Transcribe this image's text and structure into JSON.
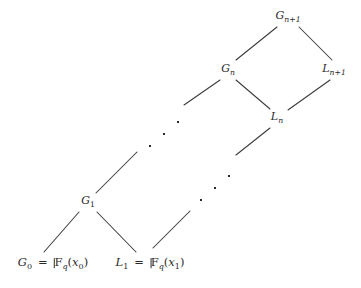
{
  "figure": {
    "kind": "lattice-diagram",
    "background_color": "#ffffff",
    "line_color": "#3a3a3a",
    "text_color": "#2b2b2b",
    "width": 361,
    "height": 288
  },
  "nodes": [
    {
      "id": "G0",
      "name": "node-g0",
      "text": "G0 = Fq(x0)",
      "parts": {
        "var": "G",
        "sub": "0",
        "eq": "=",
        "field": "F",
        "field_sub": "q",
        "open": "(",
        "arg": "x",
        "arg_sub": "0",
        "close": ")"
      },
      "x": 53,
      "y": 264
    },
    {
      "id": "L1",
      "name": "node-l1",
      "text": "L1 = Fq(x1)",
      "parts": {
        "var": "L",
        "sub": "1",
        "eq": "=",
        "field": "F",
        "field_sub": "q",
        "open": "(",
        "arg": "x",
        "arg_sub": "1",
        "close": ")"
      },
      "x": 150,
      "y": 264
    },
    {
      "id": "G1",
      "name": "node-g1",
      "text": "G1",
      "parts": {
        "var": "G",
        "sub": "1"
      },
      "x": 88,
      "y": 202
    },
    {
      "id": "Gn",
      "name": "node-gn",
      "text": "Gn",
      "parts": {
        "var": "G",
        "sub": "n"
      },
      "x": 228,
      "y": 70
    },
    {
      "id": "Ln",
      "name": "node-ln",
      "text": "Ln",
      "parts": {
        "var": "L",
        "sub": "n"
      },
      "x": 277,
      "y": 118
    },
    {
      "id": "Gn1",
      "name": "node-gn-plus-1",
      "text": "Gn+1",
      "parts": {
        "var": "G",
        "sub": "n",
        "sub_tail": "+1"
      },
      "x": 288,
      "y": 17
    },
    {
      "id": "Ln1",
      "name": "node-ln-plus-1",
      "text": "Ln+1",
      "parts": {
        "var": "L",
        "sub": "n",
        "sub_tail": "+1"
      },
      "x": 334,
      "y": 70
    }
  ],
  "edges": [
    {
      "name": "edge-g0-g1",
      "from": "G0",
      "to": "G1",
      "x1": 44,
      "y1": 252,
      "x2": 79,
      "y2": 212
    },
    {
      "name": "edge-g1-l1",
      "from": "G1",
      "to": "L1",
      "x1": 97,
      "y1": 212,
      "x2": 136,
      "y2": 252
    },
    {
      "name": "edge-g1-upper",
      "from": "G1",
      "to": "ellipsis-1",
      "x1": 96,
      "y1": 193,
      "x2": 137,
      "y2": 152
    },
    {
      "name": "edge-l1-upper",
      "from": "L1",
      "to": "ellipsis-2",
      "x1": 153,
      "y1": 248,
      "x2": 190,
      "y2": 211
    },
    {
      "name": "edge-ellipsis1-gn",
      "from": "ellipsis-1",
      "to": "Gn",
      "x1": 184,
      "y1": 105,
      "x2": 220,
      "y2": 80
    },
    {
      "name": "edge-ellipsis2-ln",
      "from": "ellipsis-2",
      "to": "Ln",
      "x1": 236,
      "y1": 155,
      "x2": 270,
      "y2": 128
    },
    {
      "name": "edge-gn-ln",
      "from": "Gn",
      "to": "Ln",
      "x1": 236,
      "y1": 80,
      "x2": 270,
      "y2": 109
    },
    {
      "name": "edge-gn-gn1",
      "from": "Gn",
      "to": "Gn1",
      "x1": 236,
      "y1": 60,
      "x2": 277,
      "y2": 27
    },
    {
      "name": "edge-gn1-ln1",
      "from": "Gn1",
      "to": "Ln1",
      "x1": 299,
      "y1": 27,
      "x2": 332,
      "y2": 60
    },
    {
      "name": "edge-ln1-ln",
      "from": "Ln1",
      "to": "Ln",
      "x1": 330,
      "y1": 80,
      "x2": 288,
      "y2": 110
    }
  ],
  "ellipses": [
    {
      "name": "ellipsis-upper",
      "x": 163,
      "y": 133,
      "dots": [
        {
          "dx": -14,
          "dy": 12
        },
        {
          "dx": 0,
          "dy": 0
        },
        {
          "dx": 14,
          "dy": -12
        }
      ]
    },
    {
      "name": "ellipsis-lower",
      "x": 214,
      "y": 187,
      "dots": [
        {
          "dx": -14,
          "dy": 12
        },
        {
          "dx": 0,
          "dy": 0
        },
        {
          "dx": 14,
          "dy": -12
        }
      ]
    }
  ]
}
